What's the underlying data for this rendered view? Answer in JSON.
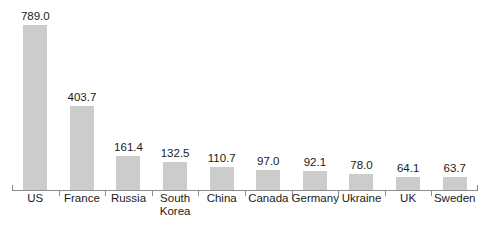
{
  "chart_data": {
    "type": "bar",
    "title": "",
    "subtitle": "",
    "xlabel": "",
    "ylabel": "",
    "ylim": [
      0,
      789.0
    ],
    "grid": false,
    "legend": false,
    "legend_position": "none",
    "orientation": "vertical",
    "bar_color": "#cccccc",
    "axis_color": "#8c8c8c",
    "text_color": "#1a1a1a",
    "background": "#ffffff",
    "value_labels_shown": true,
    "categories": [
      "US",
      "France",
      "Russia",
      "South Korea",
      "China",
      "Canada",
      "Germany",
      "Ukraine",
      "UK",
      "Sweden"
    ],
    "values": [
      789.0,
      403.7,
      161.4,
      132.5,
      110.7,
      97.0,
      92.1,
      78.0,
      64.1,
      63.7
    ],
    "value_labels": [
      "789.0",
      "403.7",
      "161.4",
      "132.5",
      "110.7",
      "97.0",
      "92.1",
      "78.0",
      "64.1",
      "63.7"
    ]
  }
}
